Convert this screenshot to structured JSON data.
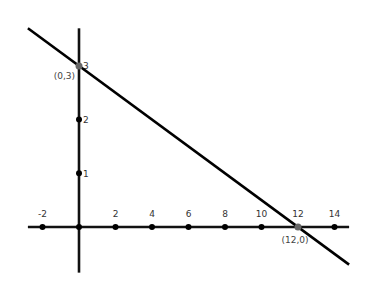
{
  "chart_data": {
    "type": "line",
    "title": "",
    "xlabel": "",
    "ylabel": "",
    "grid": false,
    "legend": null,
    "xlim": [
      -2.8,
      14.8
    ],
    "ylim": [
      -0.85,
      3.7
    ],
    "x_ticks": [
      -2,
      0,
      2,
      4,
      6,
      8,
      10,
      12,
      14
    ],
    "x_tick_labels": [
      "-2",
      "",
      "2",
      "4",
      "6",
      "8",
      "10",
      "12",
      "14"
    ],
    "y_ticks": [
      1,
      2,
      3
    ],
    "y_tick_labels": [
      "1",
      "2",
      "3"
    ],
    "series": [
      {
        "name": "line",
        "equation": "y = 3 - x/4",
        "x": [
          -2.8,
          14.8
        ],
        "y": [
          3.7,
          -0.7
        ],
        "color": "#000000"
      }
    ],
    "annotations": [
      {
        "label": "(0,3)",
        "x": 0,
        "y": 3,
        "color": "#555555"
      },
      {
        "label": "(12,0)",
        "x": 12,
        "y": 0,
        "color": "#555555"
      }
    ]
  },
  "colors": {
    "axis": "#111111",
    "line": "#000000",
    "tick_point": "#000000",
    "intercept_point": "#666666",
    "background": "#ffffff"
  }
}
